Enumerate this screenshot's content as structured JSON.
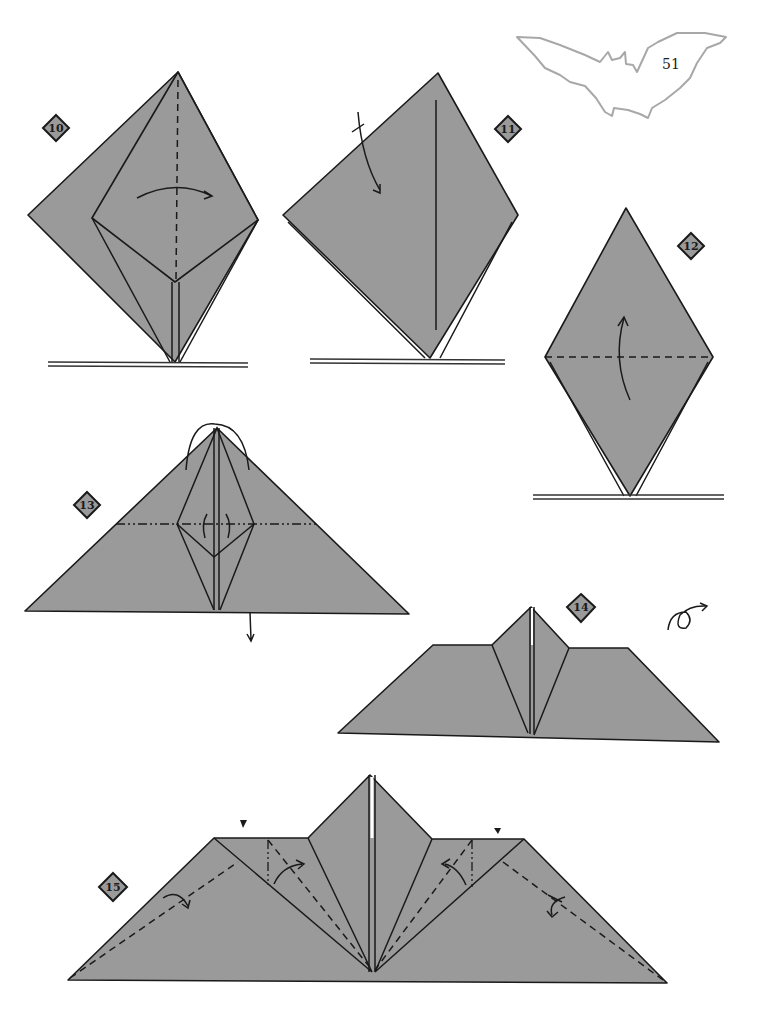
{
  "page": {
    "number": "51",
    "decoration": "bat-silhouette-outline"
  },
  "colors": {
    "paper": "#9a9a9a",
    "line": "#1a1a1a",
    "bat_outline": "#a8a8a8",
    "background": "#ffffff"
  },
  "steps": [
    {
      "number": "10",
      "symbols": [
        "valley-fold-vertical",
        "fold-arrow-right"
      ]
    },
    {
      "number": "11",
      "symbols": [
        "fold-arrow-down"
      ]
    },
    {
      "number": "12",
      "symbols": [
        "valley-fold-horizontal",
        "fold-arrow-up"
      ]
    },
    {
      "number": "13",
      "symbols": [
        "mountain-fold-horizontal",
        "fold-arrow-over-top",
        "small-arrows",
        "arrow-down"
      ]
    },
    {
      "number": "14",
      "symbols": [
        "turn-over-icon"
      ]
    },
    {
      "number": "15",
      "symbols": [
        "valley-folds",
        "mountain-folds",
        "fold-arrows",
        "push-arrows"
      ]
    }
  ]
}
